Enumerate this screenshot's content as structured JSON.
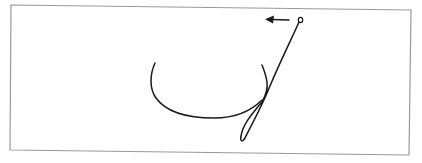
{
  "figure": {
    "frame": {
      "stroke_color": "#9a9a9a",
      "corners": {
        "tl": [
          11,
          5
        ],
        "tr": [
          411,
          10
        ],
        "br": [
          409,
          155
        ],
        "bl": [
          10,
          150
        ]
      }
    },
    "ink_color": "#1a1a1a",
    "start_marker": {
      "shape": "open-circle",
      "cx": 300,
      "cy": 20
    },
    "direction_arrow": {
      "direction": "left",
      "from": [
        289,
        20
      ],
      "to": [
        266,
        19
      ]
    },
    "stroke_label": "cursive-letter-stroke"
  }
}
